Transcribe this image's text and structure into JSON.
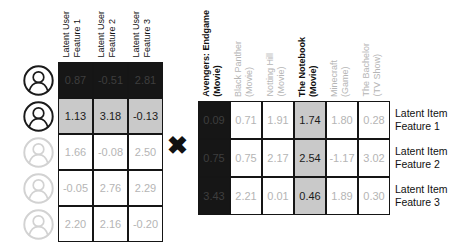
{
  "multiply_symbol": "✖",
  "colors": {
    "dark-bg": "#161616",
    "highlight-bg": "#c9c9c9",
    "muted-text": "#b5b5b5",
    "dark-cell-text": "#3e3e3e"
  },
  "left_matrix": {
    "column_headers": [
      "Latent User\nFeature 1",
      "Latent User\nFeature 2",
      "Latent User\nFeature 3"
    ],
    "rows": [
      {
        "user_icon": "user-avatar-icon",
        "highlight": "dark",
        "values": [
          "0.87",
          "-0.51",
          "2.81"
        ]
      },
      {
        "user_icon": "user-avatar-icon",
        "highlight": "selected",
        "values": [
          "1.13",
          "3.18",
          "-0.13"
        ]
      },
      {
        "user_icon": "user-avatar-icon",
        "highlight": "none",
        "values": [
          "1.66",
          "-0.08",
          "2.50"
        ]
      },
      {
        "user_icon": "user-avatar-icon",
        "highlight": "none",
        "values": [
          "-0.05",
          "2.76",
          "2.29"
        ]
      },
      {
        "user_icon": "user-avatar-icon",
        "highlight": "none",
        "values": [
          "2.20",
          "2.16",
          "-0.20"
        ]
      }
    ]
  },
  "right_matrix": {
    "column_headers": [
      {
        "label": "Avengers: Endgame\n(Movie)",
        "emphasis": "dark"
      },
      {
        "label": "Black Panther\n(Movie)",
        "emphasis": "none"
      },
      {
        "label": "Notting Hill\n(Movie)",
        "emphasis": "none"
      },
      {
        "label": "The Notebook\n(Movie)",
        "emphasis": "selected"
      },
      {
        "label": "Minecraft\n(Game)",
        "emphasis": "none"
      },
      {
        "label": "The Bachelor\n(TV Show)",
        "emphasis": "none"
      }
    ],
    "row_labels": [
      "Latent Item\nFeature 1",
      "Latent Item\nFeature 2",
      "Latent Item\nFeature 3"
    ],
    "rows": [
      [
        "0.09",
        "0.71",
        "1.91",
        "1.74",
        "1.80",
        "0.28"
      ],
      [
        "0.75",
        "0.75",
        "2.17",
        "2.54",
        "-1.17",
        "3.02"
      ],
      [
        "3.43",
        "2.21",
        "0.01",
        "0.46",
        "1.89",
        "0.30"
      ]
    ]
  }
}
